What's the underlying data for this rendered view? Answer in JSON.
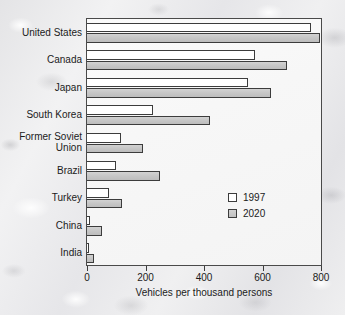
{
  "chart_data": {
    "type": "bar",
    "orientation": "horizontal",
    "title": "",
    "xlabel": "Vehicles per thousand persons",
    "ylabel": "",
    "xlim": [
      0,
      800
    ],
    "xticks": [
      0,
      200,
      400,
      600,
      800
    ],
    "xtick_labels": [
      "0",
      "200",
      "400",
      "600",
      "800"
    ],
    "grid": false,
    "legend_position": "inner-right",
    "categories": [
      "United States",
      "Canada",
      "Japan",
      "South Korea",
      "Former Soviet\nUnion",
      "Brazil",
      "Turkey",
      "China",
      "India"
    ],
    "series": [
      {
        "name": "1997",
        "color": "#ffffff",
        "values": [
          765,
          575,
          550,
          225,
          115,
          100,
          75,
          10,
          5
        ]
      },
      {
        "name": "2020",
        "color": "#c6c6c6",
        "values": [
          795,
          685,
          630,
          420,
          190,
          250,
          120,
          50,
          25
        ]
      }
    ]
  },
  "legend": {
    "entries": [
      {
        "label": "1997"
      },
      {
        "label": "2020"
      }
    ]
  },
  "colors": {
    "bar_1997_fill": "#ffffff",
    "bar_2020_fill": "#c6c6c6",
    "bar_outline": "#3c3c3c",
    "plot_background": "#f7f7f7",
    "page_background": "#ebebec",
    "text": "#1b1b1b"
  }
}
